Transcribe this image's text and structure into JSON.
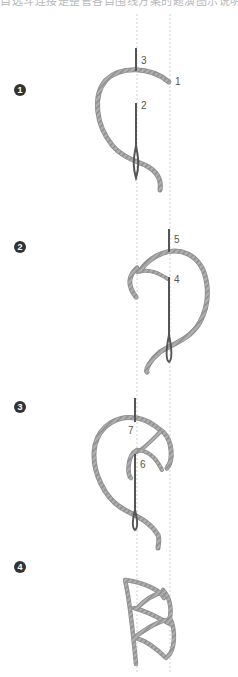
{
  "heading": "自选斗连接是整管各自围线方案的题演图示说明步骤图",
  "steps": [
    {
      "badge": "1",
      "labels": [
        "3",
        "1",
        "2"
      ]
    },
    {
      "badge": "2",
      "labels": [
        "5",
        "4"
      ]
    },
    {
      "badge": "3",
      "labels": [
        "7",
        "6"
      ]
    },
    {
      "badge": "4",
      "labels": []
    }
  ],
  "colors": {
    "thread": "#a8a8a8",
    "thread_dark": "#7a7a7a",
    "needle": "#555555",
    "guide": "#cfcfcf",
    "badge": "#333333"
  }
}
